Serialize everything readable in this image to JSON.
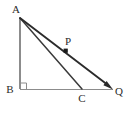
{
  "figure": {
    "type": "geometry-diagram",
    "width": 127,
    "height": 121,
    "background_color": "#ffffff",
    "stroke_colors": {
      "thin_gray": "#8c8c8c",
      "dark": "#3a3a3a",
      "ray": "#2b2b2b",
      "label": "#2b2b2b",
      "marker": "#1a1a1a"
    },
    "points": [
      {
        "name": "A",
        "label": "A",
        "x": 20,
        "y": 18,
        "label_x": 16,
        "label_y": 9
      },
      {
        "name": "B",
        "label": "B",
        "x": 20,
        "y": 89,
        "label_x": 10,
        "label_y": 89
      },
      {
        "name": "C",
        "label": "C",
        "x": 82,
        "y": 89,
        "label_x": 82,
        "label_y": 98
      },
      {
        "name": "P",
        "label": "P",
        "x": 66,
        "y": 51,
        "label_x": 68,
        "label_y": 41
      },
      {
        "name": "Q",
        "label": "Q",
        "x": 112,
        "y": 89,
        "label_x": 119,
        "label_y": 91
      }
    ],
    "segments": [
      {
        "name": "AB",
        "from": "A",
        "to": "B",
        "style": "thin-gray"
      },
      {
        "name": "BQ",
        "from": "B",
        "to": "Q",
        "style": "thin-gray"
      },
      {
        "name": "AC",
        "from": "A",
        "to": "C",
        "style": "dark"
      },
      {
        "name": "AQ",
        "from": "A",
        "to": "Q",
        "style": "ray-arrow"
      }
    ],
    "markers": {
      "right_angle_at": "B",
      "point_marker_at": "P",
      "arrowhead_at": "Q"
    }
  }
}
